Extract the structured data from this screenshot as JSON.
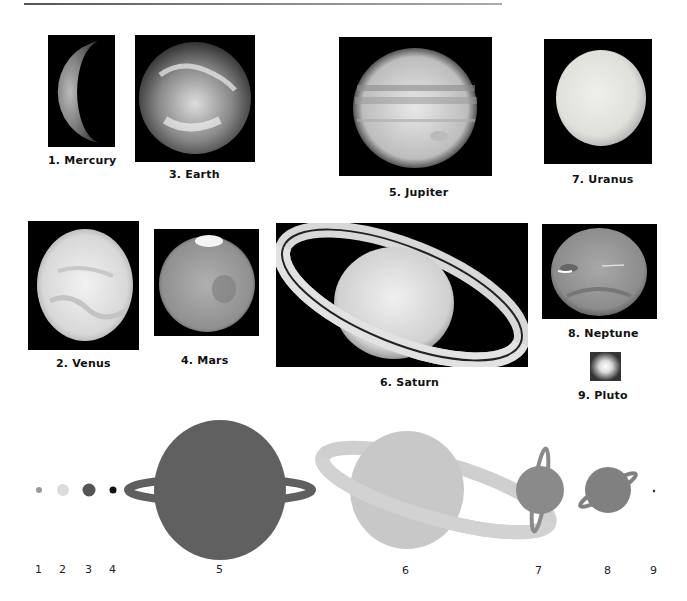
{
  "figure": {
    "photos": [
      {
        "id": 1,
        "label": "1. Mercury"
      },
      {
        "id": 2,
        "label": "2. Venus"
      },
      {
        "id": 3,
        "label": "3. Earth"
      },
      {
        "id": 4,
        "label": "4. Mars"
      },
      {
        "id": 5,
        "label": "5. Jupiter"
      },
      {
        "id": 6,
        "label": "6. Saturn"
      },
      {
        "id": 7,
        "label": "7. Uranus"
      },
      {
        "id": 8,
        "label": "8. Neptune"
      },
      {
        "id": 9,
        "label": "9. Pluto"
      }
    ],
    "scale_diagram": {
      "numbers": [
        "1",
        "2",
        "3",
        "4",
        "5",
        "6",
        "7",
        "8",
        "9"
      ],
      "colors": {
        "mercury": "#9a9a9a",
        "venus": "#dcdcdc",
        "earth": "#555555",
        "mars": "#111111",
        "jupiter": "#5f5f5f",
        "saturn": "#c8c8c8",
        "saturn_ring": "#cfcfcf",
        "uranus": "#8a8a8a",
        "neptune": "#808080",
        "pluto": "#222222"
      }
    }
  }
}
